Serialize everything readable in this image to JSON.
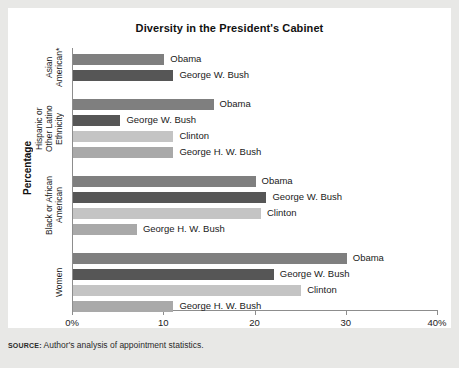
{
  "figure": {
    "title": "Diversity in the President's Cabinet",
    "y_axis_title": "Percentage",
    "source_keyword": "SOURCE:",
    "source_text": "Author's analysis of appointment statistics."
  },
  "colors": {
    "obama": "#7f7f7f",
    "george_w_bush": "#565656",
    "clinton": "#c4c4c4",
    "george_hw_bush": "#a9a9a9",
    "axis": "#8d8d8d",
    "panel": "#ffffff",
    "page": "#e8e8e6",
    "text": "#1a1a1a"
  },
  "chart_data": {
    "type": "bar",
    "orientation": "horizontal",
    "title": "Diversity in the President's Cabinet",
    "xlabel": "",
    "ylabel": "Percentage",
    "xlim": [
      0,
      40
    ],
    "grid": false,
    "legend": "inline-labels",
    "xticks": [
      0,
      10,
      20,
      30,
      40
    ],
    "xtick_labels": [
      "0%",
      "10",
      "20",
      "30",
      "40%"
    ],
    "categories": [
      "Asian American*",
      "Hispanic or Other Latino Ethnicity",
      "Black or African American",
      "Women"
    ],
    "group_label_lines": [
      [
        "Asian",
        "American*"
      ],
      [
        "Hispanic or",
        "Other Latino",
        "Ethnicity"
      ],
      [
        "Black or African",
        "American"
      ],
      [
        "Women"
      ]
    ],
    "groups": [
      {
        "category": "Asian American*",
        "bars": [
          {
            "name": "Obama",
            "value": 10.0,
            "color_key": "obama"
          },
          {
            "name": "George W. Bush",
            "value": 11.0,
            "color_key": "george_w_bush"
          }
        ]
      },
      {
        "category": "Hispanic or Other Latino Ethnicity",
        "bars": [
          {
            "name": "Obama",
            "value": 15.4,
            "color_key": "obama"
          },
          {
            "name": "George W. Bush",
            "value": 5.2,
            "color_key": "george_w_bush"
          },
          {
            "name": "Clinton",
            "value": 11.0,
            "color_key": "clinton"
          },
          {
            "name": "George H. W. Bush",
            "value": 11.0,
            "color_key": "george_hw_bush"
          }
        ]
      },
      {
        "category": "Black or African American",
        "bars": [
          {
            "name": "Obama",
            "value": 20.0,
            "color_key": "obama"
          },
          {
            "name": "George W. Bush",
            "value": 21.2,
            "color_key": "george_w_bush"
          },
          {
            "name": "Clinton",
            "value": 20.6,
            "color_key": "clinton"
          },
          {
            "name": "George H. W. Bush",
            "value": 7.0,
            "color_key": "george_hw_bush"
          }
        ]
      },
      {
        "category": "Women",
        "bars": [
          {
            "name": "Obama",
            "value": 30.0,
            "color_key": "obama"
          },
          {
            "name": "George W. Bush",
            "value": 22.0,
            "color_key": "george_w_bush"
          },
          {
            "name": "Clinton",
            "value": 25.0,
            "color_key": "clinton"
          },
          {
            "name": "George H. W. Bush",
            "value": 11.0,
            "color_key": "george_hw_bush"
          }
        ]
      }
    ]
  }
}
